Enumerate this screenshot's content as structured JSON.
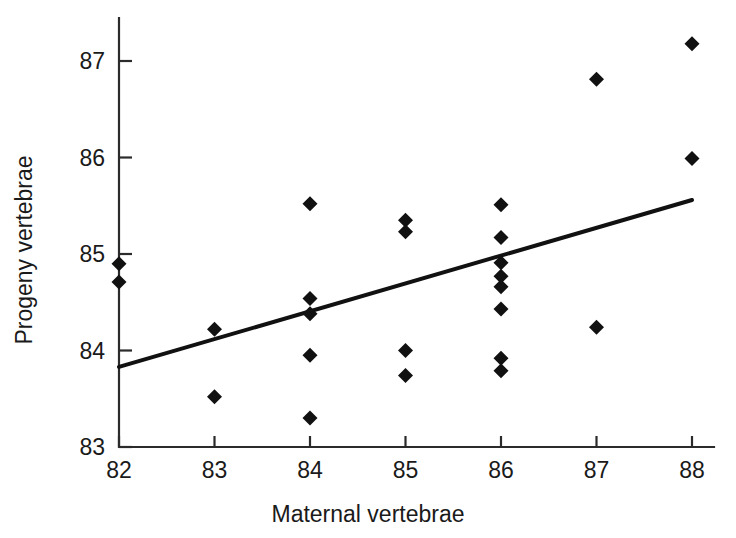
{
  "chart_data": {
    "type": "scatter",
    "title": "",
    "xlabel": "Maternal vertebrae",
    "ylabel": "Progeny vertebrae",
    "xlim": [
      82,
      88
    ],
    "ylim": [
      83,
      87.35
    ],
    "xticks": [
      82,
      83,
      84,
      85,
      86,
      87,
      88
    ],
    "yticks": [
      83,
      84,
      85,
      86,
      87
    ],
    "xtick_labels": [
      "82",
      "83",
      "84",
      "85",
      "86",
      "87",
      "88"
    ],
    "ytick_labels": [
      "83",
      "84",
      "85",
      "86",
      "87"
    ],
    "grid": false,
    "legend": null,
    "marker": "diamond",
    "marker_color": "#111111",
    "points": [
      {
        "x": 82,
        "y": 84.9
      },
      {
        "x": 82,
        "y": 84.71
      },
      {
        "x": 83,
        "y": 84.22
      },
      {
        "x": 83,
        "y": 83.52
      },
      {
        "x": 84,
        "y": 85.52
      },
      {
        "x": 84,
        "y": 84.54
      },
      {
        "x": 84,
        "y": 84.38
      },
      {
        "x": 84,
        "y": 83.95
      },
      {
        "x": 84,
        "y": 83.3
      },
      {
        "x": 85,
        "y": 85.35
      },
      {
        "x": 85,
        "y": 85.23
      },
      {
        "x": 85,
        "y": 84.0
      },
      {
        "x": 85,
        "y": 83.74
      },
      {
        "x": 86,
        "y": 85.51
      },
      {
        "x": 86,
        "y": 85.17
      },
      {
        "x": 86,
        "y": 84.91
      },
      {
        "x": 86,
        "y": 84.77
      },
      {
        "x": 86,
        "y": 84.66
      },
      {
        "x": 86,
        "y": 84.43
      },
      {
        "x": 86,
        "y": 83.92
      },
      {
        "x": 86,
        "y": 83.79
      },
      {
        "x": 87,
        "y": 86.81
      },
      {
        "x": 87,
        "y": 84.24
      },
      {
        "x": 88,
        "y": 87.18
      },
      {
        "x": 88,
        "y": 85.99
      }
    ],
    "trendline": {
      "type": "line",
      "x": [
        82,
        88
      ],
      "y": [
        83.83,
        85.56
      ]
    }
  },
  "figure": {
    "background_color": "#ffffff",
    "axis_color": "#2b2b2b",
    "text_color": "#1a1a1a"
  }
}
